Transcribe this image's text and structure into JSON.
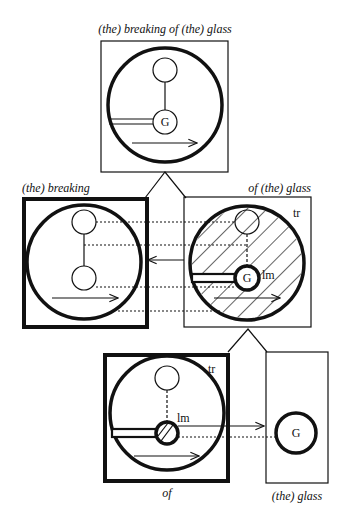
{
  "labels": {
    "top": "(the) breaking of (the) glass",
    "left": "(the) breaking",
    "right": "of (the) glass",
    "bottom_left": "of",
    "bottom_right": "(the) glass"
  },
  "marks": {
    "G": "G",
    "lm": "lm",
    "tr": "tr"
  },
  "colors": {
    "ink": "#111111",
    "background": "#ffffff"
  }
}
